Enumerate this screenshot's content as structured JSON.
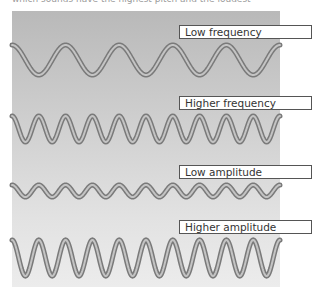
{
  "caption": "which sounds have the highest pitch and the loudest",
  "colors": {
    "wave_outline": "#7a7a7a",
    "wave_core": "#c4c4c4",
    "label_border": "#555555",
    "label_bg": "#ffffff",
    "panel_top": "#b9b9b9",
    "panel_bottom": "#ececec"
  },
  "waves": [
    {
      "label": "Low frequency",
      "label_top": 25,
      "center_y": 60,
      "amplitude": 15,
      "cycles": 5,
      "x_start": 12,
      "x_end": 280
    },
    {
      "label": "Higher frequency",
      "label_top": 96,
      "center_y": 129,
      "amplitude": 13,
      "cycles": 10,
      "x_start": 12,
      "x_end": 280
    },
    {
      "label": "Low amplitude",
      "label_top": 165,
      "center_y": 191,
      "amplitude": 6,
      "cycles": 10,
      "x_start": 12,
      "x_end": 280
    },
    {
      "label": "Higher amplitude",
      "label_top": 220,
      "center_y": 258,
      "amplitude": 18,
      "cycles": 10,
      "x_start": 12,
      "x_end": 280
    }
  ]
}
